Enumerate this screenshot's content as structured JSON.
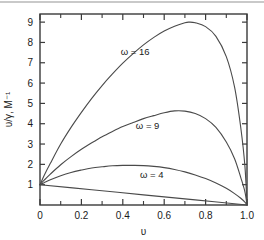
{
  "figure": {
    "background_color": "#ffffff",
    "frame_color": "#3a3a3a",
    "curve_color": "#4a4a4a",
    "top_rule_color": "#c9c9c9"
  },
  "chart_data": {
    "type": "line",
    "title": "",
    "subtitle": "",
    "xlabel": "υ",
    "ylabel": "υ/γ, M⁻¹",
    "xlim": [
      0,
      1.0
    ],
    "ylim": [
      0,
      9.4
    ],
    "grid": false,
    "legend_position": "inline-annotation",
    "x_ticks": [
      0,
      0.2,
      0.4,
      0.6,
      0.8,
      1.0
    ],
    "x_tick_labels": [
      "0",
      "0.2",
      "0.4",
      "0.6",
      "0.8",
      "1.0"
    ],
    "x_minor_ticks": [
      0.1,
      0.3,
      0.5,
      0.7,
      0.9
    ],
    "y_ticks": [
      1,
      2,
      3,
      4,
      5,
      6,
      7,
      8,
      9
    ],
    "y_tick_labels": [
      "1",
      "2",
      "3",
      "4",
      "5",
      "6",
      "7",
      "8",
      "9"
    ],
    "series": [
      {
        "name": "ω = 16",
        "label": "ω = 16",
        "label_x": 0.46,
        "label_y": 7.55,
        "peak_x": 0.72,
        "peak_y": 9.0,
        "x": [
          0.0,
          0.02,
          0.05,
          0.1,
          0.15,
          0.2,
          0.25,
          0.3,
          0.35,
          0.4,
          0.45,
          0.5,
          0.55,
          0.6,
          0.65,
          0.7,
          0.72,
          0.75,
          0.8,
          0.85,
          0.9,
          0.94,
          0.97,
          0.99,
          1.0
        ],
        "y": [
          1.0,
          1.45,
          2.05,
          3.0,
          3.82,
          4.56,
          5.25,
          5.88,
          6.45,
          6.98,
          7.45,
          7.88,
          8.25,
          8.56,
          8.8,
          8.97,
          9.0,
          8.97,
          8.78,
          8.3,
          7.3,
          5.8,
          3.8,
          1.9,
          0.0
        ]
      },
      {
        "name": "ω = 9",
        "label": "ω = 9",
        "label_x": 0.52,
        "label_y": 3.9,
        "peak_x": 0.65,
        "peak_y": 4.65,
        "x": [
          0.0,
          0.02,
          0.05,
          0.1,
          0.15,
          0.2,
          0.25,
          0.3,
          0.35,
          0.4,
          0.45,
          0.5,
          0.55,
          0.6,
          0.65,
          0.7,
          0.75,
          0.8,
          0.85,
          0.9,
          0.94,
          0.97,
          0.99,
          1.0
        ],
        "y": [
          1.0,
          1.22,
          1.52,
          1.98,
          2.38,
          2.74,
          3.06,
          3.36,
          3.62,
          3.86,
          4.06,
          4.25,
          4.4,
          4.54,
          4.63,
          4.62,
          4.5,
          4.25,
          3.82,
          3.1,
          2.28,
          1.35,
          0.65,
          0.0
        ]
      },
      {
        "name": "ω = 4",
        "label": "ω = 4",
        "label_x": 0.54,
        "label_y": 1.52,
        "peak_x": 0.45,
        "peak_y": 1.95,
        "x": [
          0.0,
          0.02,
          0.05,
          0.1,
          0.15,
          0.2,
          0.25,
          0.3,
          0.35,
          0.4,
          0.45,
          0.5,
          0.55,
          0.6,
          0.65,
          0.7,
          0.75,
          0.8,
          0.85,
          0.9,
          0.94,
          0.97,
          0.99,
          1.0
        ],
        "y": [
          1.0,
          1.1,
          1.24,
          1.44,
          1.6,
          1.72,
          1.82,
          1.88,
          1.93,
          1.95,
          1.95,
          1.94,
          1.9,
          1.84,
          1.75,
          1.63,
          1.48,
          1.3,
          1.08,
          0.82,
          0.56,
          0.33,
          0.14,
          0.0
        ]
      },
      {
        "name": "ω = 1",
        "label": "",
        "label_x": null,
        "label_y": null,
        "peak_x": 0.0,
        "peak_y": 1.0,
        "x": [
          0.0,
          0.25,
          0.5,
          0.75,
          1.0
        ],
        "y": [
          1.0,
          0.75,
          0.5,
          0.25,
          0.0
        ]
      }
    ]
  }
}
